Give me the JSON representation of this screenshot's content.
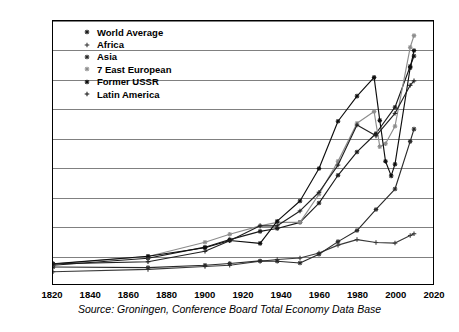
{
  "chart_data": {
    "type": "line",
    "title": "",
    "xlabel": "",
    "ylabel": "",
    "xlim": [
      1820,
      2020
    ],
    "ylim": [
      0,
      9000
    ],
    "xticks": [
      1820,
      1840,
      1860,
      1880,
      1900,
      1920,
      1940,
      1960,
      1980,
      2000,
      2020
    ],
    "yticks": [
      0,
      1000,
      2000,
      3000,
      4000,
      5000,
      6000,
      7000,
      8000,
      9000
    ],
    "ytick_labels": [
      "$0",
      "$1,000",
      "$2,000",
      "$3,000",
      "$4,000",
      "$5,000",
      "$6,000",
      "$7,000",
      "$8,000",
      "$9,000"
    ],
    "xtick_labels": [
      "1820",
      "1840",
      "1860",
      "1880",
      "1900",
      "1920",
      "1940",
      "1960",
      "1980",
      "2000",
      "2020"
    ],
    "grid": true,
    "grid_axis": "y",
    "legend_position": "upper-left-inside",
    "caption": "Source: Groningen, Conference Board Total Economy Data Base",
    "series": [
      {
        "name": "World Average",
        "marker": "asterisk",
        "color": "#1a1a1a",
        "x": [
          1820,
          1870,
          1900,
          1913,
          1929,
          1938,
          1950,
          1960,
          1970,
          1980,
          1990,
          2000,
          2008,
          2010
        ],
        "y": [
          640,
          880,
          1260,
          1520,
          1800,
          1900,
          2110,
          2770,
          3720,
          4520,
          5150,
          6050,
          7450,
          7800
        ]
      },
      {
        "name": "Africa",
        "marker": "cross",
        "color": "#3a3a3a",
        "x": [
          1820,
          1870,
          1900,
          1913,
          1929,
          1938,
          1950,
          1960,
          1970,
          1980,
          1990,
          2000,
          2008,
          2010
        ],
        "y": [
          420,
          500,
          600,
          640,
          780,
          840,
          890,
          1060,
          1330,
          1520,
          1420,
          1400,
          1660,
          1720
        ]
      },
      {
        "name": "Asia",
        "marker": "asterisk",
        "color": "#2a2a2a",
        "x": [
          1820,
          1870,
          1900,
          1913,
          1929,
          1938,
          1950,
          1960,
          1970,
          1980,
          1990,
          2000,
          2008,
          2010
        ],
        "y": [
          580,
          560,
          640,
          700,
          790,
          780,
          720,
          1020,
          1450,
          1830,
          2550,
          3250,
          4880,
          5300
        ]
      },
      {
        "name": "7 East European",
        "marker": "asterisk",
        "color": "#8c8c8c",
        "x": [
          1820,
          1870,
          1900,
          1913,
          1929,
          1938,
          1950,
          1960,
          1970,
          1980,
          1989,
          1992,
          1995,
          2000,
          2008,
          2010
        ],
        "y": [
          680,
          940,
          1430,
          1700,
          1990,
          2110,
          2110,
          3070,
          4200,
          5500,
          5900,
          4700,
          4800,
          5400,
          8100,
          8500
        ]
      },
      {
        "name": "Former USSR",
        "marker": "asterisk",
        "color": "#0d0d0d",
        "x": [
          1820,
          1870,
          1900,
          1913,
          1929,
          1938,
          1950,
          1960,
          1970,
          1980,
          1989,
          1992,
          1995,
          1998,
          2000,
          2008,
          2010
        ],
        "y": [
          690,
          950,
          1240,
          1490,
          1390,
          2150,
          2840,
          3950,
          5570,
          6430,
          7070,
          5600,
          4200,
          3700,
          4100,
          7400,
          7990
        ]
      },
      {
        "name": "Latin America",
        "marker": "cross",
        "color": "#202020",
        "x": [
          1820,
          1870,
          1900,
          1913,
          1929,
          1938,
          1950,
          1960,
          1970,
          1980,
          1990,
          2000,
          2008,
          2010
        ],
        "y": [
          690,
          760,
          1120,
          1480,
          1990,
          1990,
          2500,
          3140,
          4070,
          5440,
          5070,
          5840,
          6800,
          6950
        ]
      }
    ]
  },
  "legend": {
    "items": [
      {
        "label": "World Average"
      },
      {
        "label": "Africa"
      },
      {
        "label": "Asia"
      },
      {
        "label": "7 East European"
      },
      {
        "label": "Former USSR"
      },
      {
        "label": "Latin America"
      }
    ]
  },
  "caption": {
    "text": "Source: Groningen, Conference Board Total Economy Data Base"
  }
}
